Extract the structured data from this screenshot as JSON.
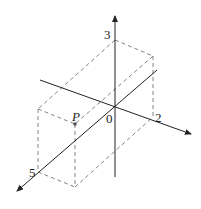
{
  "diagram": {
    "type": "3d-coordinate-box",
    "point": {
      "label": "P"
    },
    "labels": {
      "z_tick": "3",
      "y_tick": "2",
      "x_tick": "5",
      "origin": "0",
      "point": "P"
    },
    "colors": {
      "axis": "#222222",
      "dashed": "#777777",
      "point": "#555555"
    }
  }
}
